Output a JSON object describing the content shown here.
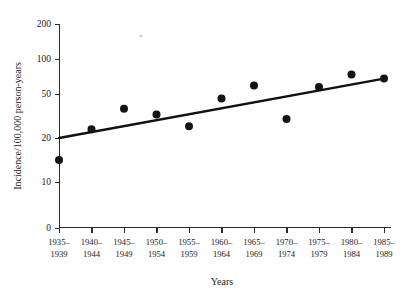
{
  "chart_data": {
    "type": "scatter",
    "title": "",
    "xlabel": "Years",
    "ylabel": "Incidence/100,000 person-years",
    "categories": [
      "1935–1939",
      "1940–1944",
      "1945–1949",
      "1950–1954",
      "1955–1959",
      "1960–1964",
      "1965–1969",
      "1970–1974",
      "1975–1979",
      "1980–1984",
      "1985–1989"
    ],
    "category_lines": [
      [
        "1935–",
        "1939"
      ],
      [
        "1940–",
        "1944"
      ],
      [
        "1945–",
        "1949"
      ],
      [
        "1950–",
        "1954"
      ],
      [
        "1955–",
        "1959"
      ],
      [
        "1960–",
        "1964"
      ],
      [
        "1965–",
        "1969"
      ],
      [
        "1970–",
        "1974"
      ],
      [
        "1975–",
        "1979"
      ],
      [
        "1980–",
        "1984"
      ],
      [
        "1985–",
        "1989"
      ]
    ],
    "values": [
      15,
      26,
      40,
      36,
      28,
      47,
      62,
      33,
      60,
      78,
      72
    ],
    "series": [
      {
        "name": "Observed incidence",
        "values": [
          15,
          26,
          40,
          36,
          28,
          47,
          62,
          33,
          60,
          78,
          72
        ]
      },
      {
        "name": "Fitted trend line",
        "type": "line",
        "endpoints": [
          {
            "x": "1935–1939",
            "y": 20
          },
          {
            "x": "1985–1989",
            "y": 72
          }
        ]
      }
    ],
    "yticks": [
      0,
      10,
      20,
      50,
      100,
      200
    ],
    "ytick_labels": [
      "0",
      "10",
      "20",
      "50",
      "100",
      "200"
    ],
    "yscale": "log-like",
    "ylim": [
      0,
      200
    ],
    "grid": false,
    "legend": "none",
    "xlabel_position": "below-axis",
    "ylabel_position": "left-rotated"
  },
  "colors": {
    "point": "#141414",
    "line": "#111111",
    "axis": "#2a2a2a",
    "background": "#ffffff",
    "text": "#1a1a1a"
  },
  "geometry": {
    "plot_left": 59,
    "plot_right": 384,
    "plot_bottom": 228,
    "plot_top": 24,
    "y_pixels": {
      "0": 228,
      "10": 182,
      "20": 138,
      "50": 94,
      "100": 59,
      "200": 24
    },
    "x_step": 32.5,
    "point_radius": 4.0
  }
}
